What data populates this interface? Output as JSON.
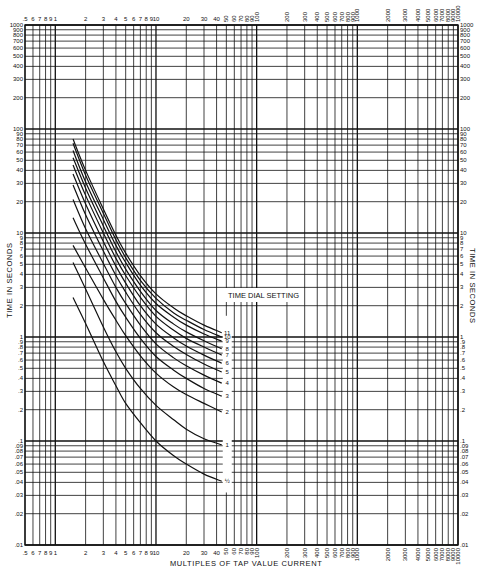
{
  "chart_data": {
    "type": "line",
    "title": "",
    "xlabel": "MULTIPLES OF TAP VALUE CURRENT",
    "ylabel": "TIME IN SECONDS",
    "xscale": "log",
    "yscale": "log",
    "xlim": [
      0.5,
      10000
    ],
    "ylim": [
      0.01,
      1000
    ],
    "grid": true,
    "legend_title": "TIME DIAL SETTING",
    "legend_position": "inline-right-of-curves",
    "x_tick_labels_top": [
      ".5",
      "6",
      "7",
      "8",
      "9",
      "1",
      "2",
      "3",
      "4",
      "5",
      "6",
      "7",
      "8",
      "9",
      "10",
      "20",
      "30",
      "40",
      "50",
      "60",
      "70",
      "80",
      "90",
      "100",
      "200",
      "300",
      "400",
      "500",
      "600",
      "700",
      "800",
      "900",
      "1000",
      "2000",
      "3000",
      "4000",
      "5000",
      "6000",
      "7000",
      "8000",
      "9000",
      "10000"
    ],
    "x_tick_labels_bottom": [
      ".5",
      "6",
      "7",
      "8",
      "9",
      "1",
      "2",
      "3",
      "4",
      "5",
      "6",
      "7",
      "8",
      "9",
      "10",
      "20",
      "30",
      "40",
      "50",
      "60",
      "70",
      "80",
      "90",
      "100",
      "200",
      "300",
      "400",
      "500",
      "600",
      "700",
      "800",
      "900",
      "1000",
      "2000",
      "3000",
      "4000",
      "5000",
      "6000",
      "7000",
      "8000",
      "9000",
      "10000"
    ],
    "y_tick_labels": [
      "1000",
      "900",
      "800",
      "700",
      "600",
      "500",
      "400",
      "300",
      "200",
      "100",
      "90",
      "80",
      "70",
      "60",
      "50",
      "40",
      "30",
      "20",
      "10",
      "9",
      "8",
      "7",
      "6",
      "5",
      "4",
      "3",
      "2",
      "1",
      ".9",
      ".8",
      ".7",
      ".6",
      ".5",
      ".4",
      ".3",
      ".2",
      ".1",
      ".09",
      ".08",
      ".07",
      ".06",
      ".05",
      ".04",
      ".03",
      ".02",
      ".01"
    ],
    "x": [
      1.5,
      2,
      3,
      4,
      5,
      7,
      10,
      15,
      20,
      30,
      45
    ],
    "series": [
      {
        "name": "11",
        "values": [
          80,
          40,
          17,
          9.5,
          6.4,
          3.9,
          2.6,
          1.9,
          1.6,
          1.3,
          1.1
        ]
      },
      {
        "name": "10",
        "values": [
          73,
          36,
          15.5,
          8.6,
          5.8,
          3.5,
          2.35,
          1.7,
          1.45,
          1.18,
          1.0
        ]
      },
      {
        "name": "9",
        "values": [
          62,
          31,
          13.5,
          7.6,
          5.2,
          3.15,
          2.1,
          1.55,
          1.3,
          1.07,
          0.91
        ]
      },
      {
        "name": "8",
        "values": [
          53,
          27,
          11.7,
          6.6,
          4.5,
          2.75,
          1.8,
          1.33,
          1.12,
          0.92,
          0.77
        ]
      },
      {
        "name": "7",
        "values": [
          45,
          23,
          10,
          5.7,
          3.9,
          2.4,
          1.58,
          1.16,
          0.97,
          0.8,
          0.67
        ]
      },
      {
        "name": "6",
        "values": [
          37,
          19,
          8.3,
          4.8,
          3.3,
          2.0,
          1.33,
          0.98,
          0.82,
          0.67,
          0.56
        ]
      },
      {
        "name": "5",
        "values": [
          29,
          15,
          6.7,
          3.9,
          2.7,
          1.65,
          1.1,
          0.81,
          0.68,
          0.55,
          0.46
        ]
      },
      {
        "name": "4",
        "values": [
          21,
          11,
          5.1,
          3.0,
          2.1,
          1.3,
          0.86,
          0.63,
          0.53,
          0.43,
          0.36
        ]
      },
      {
        "name": "3",
        "values": [
          14,
          7.8,
          3.7,
          2.2,
          1.55,
          0.97,
          0.65,
          0.48,
          0.4,
          0.32,
          0.27
        ]
      },
      {
        "name": "2",
        "values": [
          7.6,
          4.6,
          2.3,
          1.45,
          1.03,
          0.66,
          0.45,
          0.33,
          0.28,
          0.23,
          0.19
        ]
      },
      {
        "name": "1",
        "values": [
          5.2,
          2.9,
          1.25,
          0.72,
          0.5,
          0.32,
          0.22,
          0.16,
          0.13,
          0.105,
          0.092
        ]
      },
      {
        "name": "1/2",
        "values": [
          2.4,
          1.35,
          0.58,
          0.34,
          0.23,
          0.15,
          0.1,
          0.072,
          0.06,
          0.048,
          0.041
        ]
      }
    ]
  },
  "labels": {
    "x_axis_title": "MULTIPLES OF TAP VALUE CURRENT",
    "y_axis_title_left": "TIME IN SECONDS",
    "y_axis_title_right": "TIME IN SECONDS",
    "legend_title": "TIME DIAL SETTING"
  }
}
